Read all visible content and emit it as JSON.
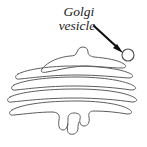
{
  "figure": {
    "background_color": "#ffffff",
    "width": 147,
    "height": 147
  },
  "callout": {
    "label_line1": "Golgi",
    "label_line2": "vesicle",
    "text_color": "#1a1a1a",
    "arrow_color": "#101010"
  },
  "vesicle": {
    "name": "golgi-vesicle",
    "cx": 128,
    "cy": 55,
    "r": 6,
    "stroke_color": "#4a4a4a",
    "fill_color": "#ffffff"
  },
  "golgi": {
    "stroke_color": "#5d5d5d",
    "cisterna_count": 5,
    "cisternae": [
      {
        "name": "cisterna-1-top",
        "has_bump": true,
        "bump_direction": "up"
      },
      {
        "name": "cisterna-2",
        "has_bump": false,
        "bump_direction": "none"
      },
      {
        "name": "cisterna-3",
        "has_bump": false,
        "bump_direction": "none"
      },
      {
        "name": "cisterna-4",
        "has_bump": false,
        "bump_direction": "none"
      },
      {
        "name": "cisterna-5-bottom",
        "has_bump": true,
        "bump_direction": "down"
      }
    ]
  }
}
